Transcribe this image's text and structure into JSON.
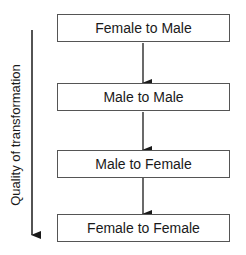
{
  "diagram": {
    "axis_label": "Quality of transformation",
    "axis_direction": "decreasing downward",
    "boxes": [
      {
        "label": "Female to Male"
      },
      {
        "label": "Male to Male"
      },
      {
        "label": "Male to Female"
      },
      {
        "label": "Female to Female"
      }
    ],
    "connections": [
      {
        "from": "Female to Male",
        "to": "Male to Male"
      },
      {
        "from": "Male to Male",
        "to": "Male to Female"
      },
      {
        "from": "Male to Female",
        "to": "Female to Female"
      }
    ]
  }
}
